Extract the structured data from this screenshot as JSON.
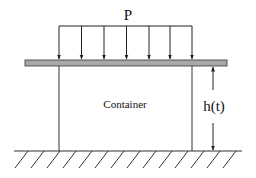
{
  "diagram": {
    "load_label": "P",
    "container_label": "Container",
    "height_label": "h(t)",
    "arrow_count": 7,
    "colors": {
      "line": "#222222",
      "plate_fill": "#a8a8a8",
      "background": "#ffffff"
    }
  }
}
